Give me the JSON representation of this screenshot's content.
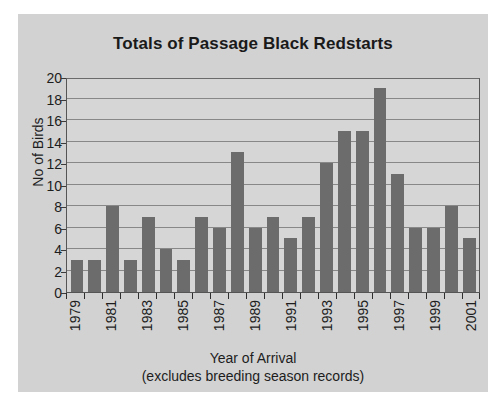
{
  "figure": {
    "background_color": "#d2d2d2",
    "page_background_color": "#ffffff"
  },
  "chart_data": {
    "type": "bar",
    "title": "Totals of Passage Black Redstarts",
    "xlabel": "Year of Arrival",
    "xlabel_note": "(excludes breeding season records)",
    "ylabel": "No of Birds",
    "ylim": [
      0,
      20
    ],
    "ytick_step": 2,
    "yticks": [
      20,
      18,
      16,
      14,
      12,
      10,
      8,
      6,
      4,
      2,
      0
    ],
    "ytick_labels": [
      "20",
      "18",
      "16",
      "14",
      "12",
      "10",
      "8",
      "6",
      "4",
      "2",
      "0"
    ],
    "grid": true,
    "legend": false,
    "bar_color": "#6c6c6c",
    "plot_background_color": "#d6d6d6",
    "categories": [
      "1979",
      "1980",
      "1981",
      "1982",
      "1983",
      "1984",
      "1985",
      "1986",
      "1987",
      "1988",
      "1989",
      "1990",
      "1991",
      "1992",
      "1993",
      "1994",
      "1995",
      "1996",
      "1997",
      "1998",
      "1999",
      "2000",
      "2001"
    ],
    "values": [
      3,
      3,
      8,
      3,
      7,
      4,
      3,
      7,
      6,
      13,
      6,
      7,
      5,
      7,
      12,
      15,
      15,
      19,
      11,
      6,
      6,
      8,
      5
    ],
    "visible_xtick_labels": [
      "1979",
      "1981",
      "1983",
      "1985",
      "1987",
      "1989",
      "1991",
      "1993",
      "1995",
      "1997",
      "1999",
      "2001"
    ],
    "xtick_label_rotation": 90
  }
}
